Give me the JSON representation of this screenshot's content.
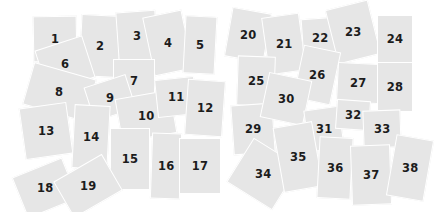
{
  "colors": {
    "tile": "#e6e6e6",
    "gap": "#ffffff",
    "text": "#1c1c1c"
  },
  "tiles": [
    {
      "n": "1",
      "x": 33,
      "y": 16,
      "w": 44,
      "h": 46,
      "r": -1
    },
    {
      "n": "2",
      "x": 80,
      "y": 15,
      "w": 40,
      "h": 62,
      "r": 3
    },
    {
      "n": "3",
      "x": 117,
      "y": 11,
      "w": 40,
      "h": 50,
      "r": -4
    },
    {
      "n": "4",
      "x": 148,
      "y": 13,
      "w": 40,
      "h": 60,
      "r": -12
    },
    {
      "n": "5",
      "x": 184,
      "y": 16,
      "w": 32,
      "h": 58,
      "r": 3
    },
    {
      "n": "6",
      "x": 40,
      "y": 42,
      "w": 50,
      "h": 44,
      "r": -18
    },
    {
      "n": "7",
      "x": 113,
      "y": 59,
      "w": 42,
      "h": 44,
      "r": 0
    },
    {
      "n": "8",
      "x": 27,
      "y": 70,
      "w": 65,
      "h": 44,
      "r": 16
    },
    {
      "n": "9",
      "x": 88,
      "y": 80,
      "w": 44,
      "h": 36,
      "r": -18
    },
    {
      "n": "10",
      "x": 118,
      "y": 94,
      "w": 56,
      "h": 44,
      "r": -10
    },
    {
      "n": "11",
      "x": 156,
      "y": 78,
      "w": 40,
      "h": 38,
      "r": -6
    },
    {
      "n": "12",
      "x": 186,
      "y": 80,
      "w": 38,
      "h": 56,
      "r": 4
    },
    {
      "n": "13",
      "x": 22,
      "y": 105,
      "w": 48,
      "h": 52,
      "r": -8
    },
    {
      "n": "14",
      "x": 73,
      "y": 105,
      "w": 36,
      "h": 64,
      "r": 3
    },
    {
      "n": "15",
      "x": 110,
      "y": 128,
      "w": 40,
      "h": 62,
      "r": 0
    },
    {
      "n": "16",
      "x": 151,
      "y": 133,
      "w": 30,
      "h": 66,
      "r": 2
    },
    {
      "n": "17",
      "x": 179,
      "y": 138,
      "w": 42,
      "h": 56,
      "r": 0
    },
    {
      "n": "18",
      "x": 18,
      "y": 166,
      "w": 54,
      "h": 44,
      "r": -22
    },
    {
      "n": "19",
      "x": 60,
      "y": 165,
      "w": 56,
      "h": 42,
      "r": -30
    },
    {
      "n": "20",
      "x": 228,
      "y": 10,
      "w": 40,
      "h": 50,
      "r": 10
    },
    {
      "n": "21",
      "x": 265,
      "y": 15,
      "w": 38,
      "h": 58,
      "r": -8
    },
    {
      "n": "22",
      "x": 302,
      "y": 18,
      "w": 36,
      "h": 40,
      "r": -4
    },
    {
      "n": "23",
      "x": 331,
      "y": 4,
      "w": 44,
      "h": 56,
      "r": -14
    },
    {
      "n": "24",
      "x": 377,
      "y": 15,
      "w": 36,
      "h": 48,
      "r": 0
    },
    {
      "n": "25",
      "x": 237,
      "y": 56,
      "w": 38,
      "h": 50,
      "r": 2
    },
    {
      "n": "26",
      "x": 298,
      "y": 48,
      "w": 38,
      "h": 54,
      "r": 12
    },
    {
      "n": "27",
      "x": 337,
      "y": 63,
      "w": 42,
      "h": 40,
      "r": 3
    },
    {
      "n": "28",
      "x": 377,
      "y": 62,
      "w": 36,
      "h": 50,
      "r": 0
    },
    {
      "n": "29",
      "x": 232,
      "y": 104,
      "w": 42,
      "h": 50,
      "r": -4
    },
    {
      "n": "30",
      "x": 264,
      "y": 76,
      "w": 44,
      "h": 46,
      "r": 12
    },
    {
      "n": "31",
      "x": 306,
      "y": 108,
      "w": 36,
      "h": 42,
      "r": -8
    },
    {
      "n": "32",
      "x": 336,
      "y": 100,
      "w": 34,
      "h": 30,
      "r": 4
    },
    {
      "n": "33",
      "x": 363,
      "y": 110,
      "w": 38,
      "h": 38,
      "r": -2
    },
    {
      "n": "34",
      "x": 236,
      "y": 148,
      "w": 54,
      "h": 52,
      "r": 32
    },
    {
      "n": "35",
      "x": 278,
      "y": 124,
      "w": 40,
      "h": 66,
      "r": -10
    },
    {
      "n": "36",
      "x": 318,
      "y": 137,
      "w": 34,
      "h": 62,
      "r": 3
    },
    {
      "n": "37",
      "x": 351,
      "y": 145,
      "w": 40,
      "h": 60,
      "r": -2
    },
    {
      "n": "38",
      "x": 391,
      "y": 137,
      "w": 38,
      "h": 62,
      "r": 10
    }
  ]
}
